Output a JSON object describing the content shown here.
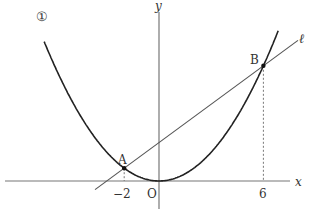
{
  "diagram": {
    "curve_label": "①",
    "axis_labels": {
      "x": "x",
      "y": "y",
      "origin": "O"
    },
    "line_label": "ℓ",
    "points": [
      {
        "name": "A",
        "x": -2,
        "y": 2
      },
      {
        "name": "B",
        "x": 6,
        "y": 18
      }
    ],
    "tick_labels": [
      "−2",
      "6"
    ],
    "parabola": {
      "equation_form": "y = a x^2",
      "a": 0.5
    },
    "line": {
      "passes_through": [
        "A",
        "B"
      ]
    },
    "colors": {
      "curve": "#222222",
      "line": "#555555",
      "axis": "#777777",
      "text": "#333333"
    }
  }
}
